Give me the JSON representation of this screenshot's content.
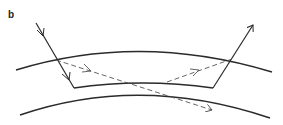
{
  "figure": {
    "panel_label": "b",
    "colors": {
      "line": "#2a2a2a",
      "dashed": "#555555",
      "background": "#ffffff"
    },
    "elements": {
      "upper_boundary": "curved interface (outer)",
      "inner_boundary": "curved interface (reflecting layer bottom)",
      "lower_boundary": "curved interface (lower)",
      "incident_ray": "solid arrow entering from upper-left",
      "exit_ray": "solid arrow leaving toward upper-right",
      "dashed_ray_down": "dashed arrow continuing downward-right",
      "dashed_ray_up": "dashed arrow rising to exit point"
    }
  }
}
